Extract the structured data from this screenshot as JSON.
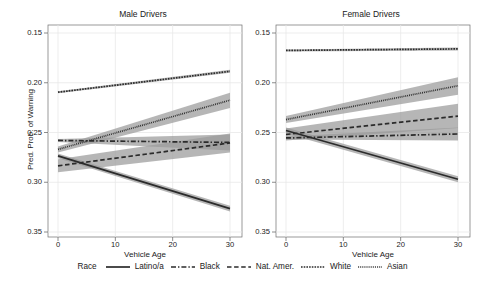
{
  "figure": {
    "ylabel": "Pred. Prob. of Warning",
    "xlabel_left": "Vehicle Age",
    "xlabel_right": "Vehicle Age",
    "panel_titles": [
      "Male Drivers",
      "Female Drivers"
    ],
    "yticks": [
      "0.35",
      "0.30",
      "0.25",
      "0.20",
      "0.15"
    ],
    "xticks": [
      "0",
      "10",
      "20",
      "30"
    ]
  },
  "legend": {
    "title": "Race",
    "entries": [
      {
        "label": "Latino/a",
        "style": "solid"
      },
      {
        "label": "Black",
        "style": "dashdot"
      },
      {
        "label": "Nat. Amer.",
        "style": "dashed"
      },
      {
        "label": "White",
        "style": "dotted"
      },
      {
        "label": "Asian",
        "style": "finedotted"
      }
    ]
  },
  "colors": {
    "line": "#2b2b2b",
    "band": "#9a9a9a",
    "grid": "#e8e8e8",
    "axis": "#6e6e6e",
    "background": "#ffffff"
  },
  "chart_data": {
    "type": "line",
    "xlabel": "Vehicle Age",
    "ylabel": "Pred. Prob. of Warning",
    "xlim": [
      0,
      30
    ],
    "ylim": [
      0.15,
      0.35
    ],
    "xticks": [
      0,
      10,
      20,
      30
    ],
    "yticks": [
      0.15,
      0.2,
      0.25,
      0.3,
      0.35
    ],
    "grid": true,
    "legend_position": "bottom",
    "legend_title": "Race",
    "x": [
      0,
      30
    ],
    "panels": [
      {
        "name": "Male Drivers",
        "series": [
          {
            "name": "Latino/a",
            "style": "solid",
            "values": [
              0.2265,
              0.1735
            ],
            "band_lo": [
              0.224,
              0.1705
            ],
            "band_hi": [
              0.229,
              0.1765
            ]
          },
          {
            "name": "Black",
            "style": "dashdot",
            "values": [
              0.242,
              0.24
            ],
            "band_lo": [
              0.2405,
              0.232
            ],
            "band_hi": [
              0.2435,
              0.248
            ]
          },
          {
            "name": "Nat. Amer.",
            "style": "dashed",
            "values": [
              0.2165,
              0.2395
            ],
            "band_lo": [
              0.21,
              0.23
            ],
            "band_hi": [
              0.223,
              0.249
            ]
          },
          {
            "name": "White",
            "style": "dotted",
            "values": [
              0.2905,
              0.3115
            ],
            "band_lo": [
              0.2895,
              0.31
            ],
            "band_hi": [
              0.2915,
              0.313
            ]
          },
          {
            "name": "Asian",
            "style": "finedotted",
            "values": [
              0.233,
              0.2825
            ],
            "band_lo": [
              0.23,
              0.2745
            ],
            "band_hi": [
              0.236,
              0.29
            ]
          }
        ]
      },
      {
        "name": "Female Drivers",
        "series": [
          {
            "name": "Latino/a",
            "style": "solid",
            "values": [
              0.252,
              0.203
            ],
            "band_lo": [
              0.249,
              0.2
            ],
            "band_hi": [
              0.255,
              0.206
            ]
          },
          {
            "name": "Black",
            "style": "dashdot",
            "values": [
              0.2445,
              0.2485
            ],
            "band_lo": [
              0.243,
              0.242
            ],
            "band_hi": [
              0.246,
              0.255
            ]
          },
          {
            "name": "Nat. Amer.",
            "style": "dashed",
            "values": [
              0.248,
              0.2665
            ],
            "band_lo": [
              0.242,
              0.2545
            ],
            "band_hi": [
              0.254,
              0.279
            ]
          },
          {
            "name": "White",
            "style": "dotted",
            "values": [
              0.3325,
              0.334
            ],
            "band_lo": [
              0.3315,
              0.3325
            ],
            "band_hi": [
              0.3335,
              0.3355
            ]
          },
          {
            "name": "Asian",
            "style": "finedotted",
            "values": [
              0.263,
              0.297
            ],
            "band_lo": [
              0.2595,
              0.288
            ],
            "band_hi": [
              0.2665,
              0.3055
            ]
          }
        ]
      }
    ]
  }
}
